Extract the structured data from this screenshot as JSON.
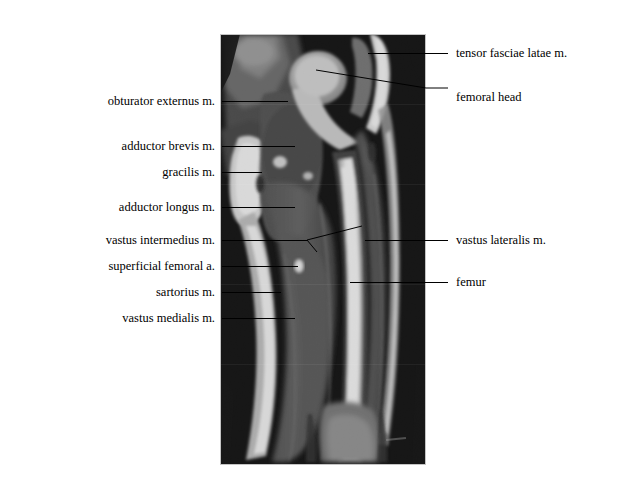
{
  "figure": {
    "background_color": "#ffffff",
    "text_color": "#000000",
    "leader_color": "#000000"
  },
  "scan": {
    "modality": "MRI",
    "view": "coronal",
    "region": "thigh",
    "frame": {
      "x": 220,
      "y": 34,
      "width": 206,
      "height": 431
    },
    "border_color": "#bfbfbf",
    "background_color": "#050505"
  },
  "labels_left": [
    {
      "id": "obturator-externus",
      "text": "obturator externus m.",
      "text_x": 215,
      "text_y": 101,
      "line_x1": 222,
      "line_x2": 288,
      "line_y": 101
    },
    {
      "id": "adductor-brevis",
      "text": "adductor brevis m.",
      "text_x": 215,
      "text_y": 146,
      "line_x1": 222,
      "line_x2": 295,
      "line_y": 146
    },
    {
      "id": "gracilis",
      "text": "gracilis m.",
      "text_x": 215,
      "text_y": 172,
      "line_x1": 222,
      "line_x2": 262,
      "line_y": 172
    },
    {
      "id": "adductor-longus",
      "text": "adductor longus m.",
      "text_x": 215,
      "text_y": 207,
      "line_x1": 222,
      "line_x2": 295,
      "line_y": 207
    },
    {
      "id": "vastus-intermedius",
      "text": "vastus intermedius m.",
      "text_x": 215,
      "text_y": 240,
      "line_x1": 222,
      "line_x2": 307,
      "line_y": 240
    },
    {
      "id": "superficial-femoral-artery",
      "text": "superficial femoral a.",
      "text_x": 215,
      "text_y": 266,
      "line_x1": 222,
      "line_x2": 298,
      "line_y": 266
    },
    {
      "id": "sartorius",
      "text": "sartorius m.",
      "text_x": 215,
      "text_y": 292,
      "line_x1": 222,
      "line_x2": 281,
      "line_y": 292
    },
    {
      "id": "vastus-medialis",
      "text": "vastus medialis m.",
      "text_x": 215,
      "text_y": 318,
      "line_x1": 222,
      "line_x2": 295,
      "line_y": 318
    }
  ],
  "labels_right": [
    {
      "id": "tensor-fasciae-latae",
      "text": "tensor fasciae latae m.",
      "text_x": 456,
      "text_y": 53,
      "line_x1": 368,
      "line_x2": 448,
      "line_y": 53
    },
    {
      "id": "femoral-head",
      "text": "femoral head",
      "text_x": 456,
      "text_y": 97,
      "line_x1": 316,
      "line_x2": 448,
      "line_y": 97
    },
    {
      "id": "vastus-lateralis",
      "text": "vastus lateralis m.",
      "text_x": 456,
      "text_y": 240,
      "line_x1": 365,
      "line_x2": 448,
      "line_y": 240
    },
    {
      "id": "femur",
      "text": "femur",
      "text_x": 456,
      "text_y": 282,
      "line_x1": 350,
      "line_x2": 448,
      "line_y": 282
    }
  ],
  "leader_branch": {
    "id": "vastus-intermedius-fork",
    "origin_x": 307,
    "origin_y": 240,
    "upper_x": 362,
    "upper_y": 226,
    "lower_x": 317,
    "lower_y": 252
  },
  "anatomy_notes": {
    "bright_tissue": "subcutaneous fat and bone marrow",
    "mid_gray_tissue": "skeletal muscle",
    "dark_tissue": "cortical bone and air/background"
  }
}
